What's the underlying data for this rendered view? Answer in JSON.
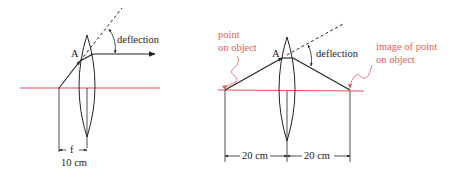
{
  "colors": {
    "ink": "#222222",
    "axis": "#e8505a",
    "annotation": "#e0605a"
  },
  "left_diagram": {
    "point_label": "A",
    "deflection_label": "deflection",
    "focal_symbol": "f",
    "focal_distance": "10 cm"
  },
  "right_diagram": {
    "point_label": "A",
    "deflection_label": "deflection",
    "object_annotation": [
      "point",
      "on object"
    ],
    "image_annotation": [
      "image of point",
      "on object"
    ],
    "object_distance": "20 cm",
    "image_distance": "20 cm"
  }
}
